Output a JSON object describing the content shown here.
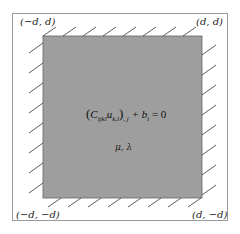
{
  "diagram": {
    "corners": {
      "top_left": "(−d, d)",
      "top_right": "(d, d)",
      "bottom_left": "(−d, −d)",
      "bottom_right": "(d, −d)"
    },
    "equation": "(C_ijkl u_k,l),j + b_i = 0",
    "equation_parts": {
      "open": "(",
      "C": "C",
      "C_sub": "ijkl",
      "u": "u",
      "u_sub": "k,l",
      "close": ")",
      "outer_sub": ", j",
      "rest": " + b",
      "b_sub": "i",
      "eq": " = 0"
    },
    "parameters": "μ, λ",
    "colors": {
      "domain_fill": "#9e9e9e",
      "border": "#9a9a9a",
      "hatch": "#333333"
    }
  }
}
